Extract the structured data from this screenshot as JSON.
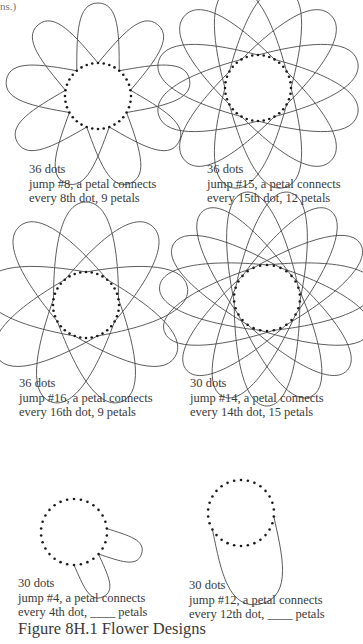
{
  "page": {
    "top_fragment": "ns.)",
    "figure_title": "Figure 8H.1 Flower Designs"
  },
  "designs": [
    {
      "id": "d1",
      "dots": 36,
      "jump": 8,
      "petals_drawn": 9,
      "center": [
        98,
        96
      ],
      "dot_radius": 33,
      "petal_reach": 60,
      "petal_width": 0.5,
      "rotation": 90,
      "caption_pos": [
        29,
        162
      ],
      "lines": [
        "36 dots",
        "jump #8, a petal connects",
        "every 8th dot, 9 petals"
      ]
    },
    {
      "id": "d2",
      "dots": 36,
      "jump": 15,
      "petals_drawn": 12,
      "center": [
        258,
        88
      ],
      "dot_radius": 33,
      "petal_reach": 70,
      "petal_width": 0.42,
      "rotation": 90,
      "caption_pos": [
        207,
        162
      ],
      "lines": [
        "36 dots",
        "jump #15, a petal connects",
        "every 15th dot, 12 petals"
      ]
    },
    {
      "id": "d3",
      "dots": 36,
      "jump": 16,
      "petals_drawn": 9,
      "center": [
        86,
        305
      ],
      "dot_radius": 33,
      "petal_reach": 70,
      "petal_width": 0.42,
      "rotation": 90,
      "caption_pos": [
        19,
        376
      ],
      "lines": [
        "36 dots",
        "jump #16, a petal connects",
        "every 16th dot, 9 petals"
      ]
    },
    {
      "id": "d4",
      "dots": 30,
      "jump": 14,
      "petals_drawn": 15,
      "center": [
        267,
        298
      ],
      "dot_radius": 33,
      "petal_reach": 75,
      "petal_width": 0.38,
      "rotation": 90,
      "caption_pos": [
        190,
        376
      ],
      "lines": [
        "30 dots",
        "jump #14, a petal connects",
        "every 14th dot, 15 petals"
      ]
    },
    {
      "id": "d5",
      "dots": 30,
      "jump": 4,
      "petals_drawn": 2,
      "partial": true,
      "center": [
        74,
        532
      ],
      "dot_radius": 33,
      "petal_reach": 38,
      "petal_width": 0.55,
      "rotation": 90,
      "start_dots": [
        11,
        15
      ],
      "caption_pos": [
        18,
        576
      ],
      "lines": [
        "30 dots",
        "jump #4, a petal connects",
        "every 4th dot, ____ petals"
      ]
    },
    {
      "id": "d6",
      "dots": 30,
      "jump": 12,
      "petals_drawn": 1,
      "partial": true,
      "center": [
        241,
        513
      ],
      "dot_radius": 33,
      "petal_reach": 60,
      "petal_width": 0.55,
      "rotation": 90,
      "caption_pos": [
        189,
        578
      ],
      "lines": [
        "30 dots",
        "jump #12, a petal connects",
        "every 12th dot, ____ petals"
      ]
    }
  ],
  "colors": {
    "ink": "#3a3a3a",
    "dot": "#1a1a1a",
    "line": "#4a4a4a"
  }
}
